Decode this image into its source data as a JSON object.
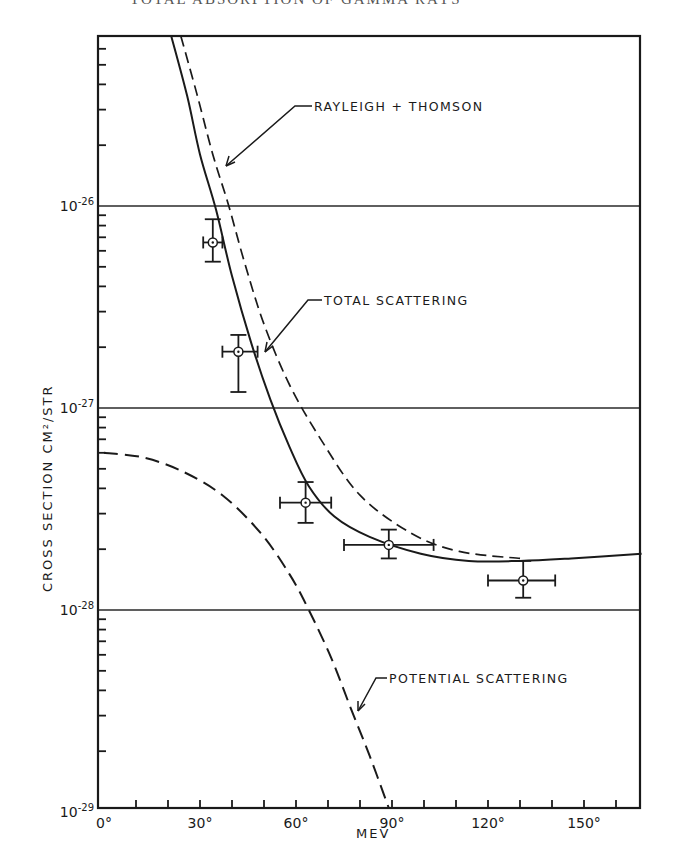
{
  "page": {
    "header_text": "TOTAL ABSORPTION OF GAMMA RAYS"
  },
  "chart_data": {
    "type": "line",
    "title": "",
    "xlabel": "MEV",
    "ylabel": "CROSS SECTION CM²/STR",
    "x_unit": "degrees",
    "xlim": [
      0,
      170
    ],
    "ylim": [
      1e-29,
      7e-26
    ],
    "yscale": "log",
    "grid": "horizontal lines at decades",
    "x_ticks": [
      {
        "value": 0,
        "label": "0°"
      },
      {
        "value": 30,
        "label": "30°"
      },
      {
        "value": 60,
        "label": "60°"
      },
      {
        "value": 90,
        "label": "90°"
      },
      {
        "value": 120,
        "label": "120°"
      },
      {
        "value": 150,
        "label": "150°"
      }
    ],
    "y_ticks": [
      {
        "value": 1e-26,
        "base": "10",
        "exp": "-26"
      },
      {
        "value": 1e-27,
        "base": "10",
        "exp": "-27"
      },
      {
        "value": 1e-28,
        "base": "10",
        "exp": "-28"
      },
      {
        "value": 1e-29,
        "base": "10",
        "exp": "-29"
      }
    ],
    "series": [
      {
        "name": "TOTAL SCATTERING",
        "style": "solid",
        "x": [
          21,
          26,
          30,
          35,
          40,
          46,
          52,
          58,
          64,
          72,
          83,
          99,
          114,
          130,
          146,
          168
        ],
        "y": [
          7e-26,
          3.5e-26,
          1.8e-26,
          9.6e-27,
          4.5e-27,
          2.1e-27,
          1.1e-27,
          6.4e-28,
          4.1e-28,
          2.9e-28,
          2.3e-28,
          1.9e-28,
          1.75e-28,
          1.75e-28,
          1.8e-28,
          1.9e-28
        ]
      },
      {
        "name": "RAYLEIGH + THOMSON",
        "style": "dashed",
        "x": [
          24,
          29,
          34,
          39,
          44,
          50,
          58,
          68,
          80,
          96,
          111,
          130
        ],
        "y": [
          7e-26,
          3.6e-26,
          1.8e-26,
          1e-26,
          5.2e-27,
          2.6e-27,
          1.3e-27,
          6.9e-28,
          3.7e-28,
          2.4e-28,
          1.95e-28,
          1.8e-28
        ]
      },
      {
        "name": "POTENTIAL SCATTERING",
        "style": "dashed",
        "x": [
          0,
          12,
          24,
          37,
          49,
          58,
          64,
          71,
          77,
          83,
          89
        ],
        "y": [
          6e-28,
          5.7e-28,
          4.9e-28,
          3.7e-28,
          2.4e-28,
          1.5e-28,
          1e-28,
          5.8e-29,
          3.3e-29,
          1.9e-29,
          1e-29
        ]
      }
    ],
    "data_points": [
      {
        "x": 34,
        "y": 6.6e-27,
        "x_err": [
          31,
          37
        ],
        "y_err": [
          5.3e-27,
          8.6e-27
        ]
      },
      {
        "x": 42,
        "y": 1.9e-27,
        "x_err": [
          37,
          48
        ],
        "y_err": [
          1.2e-27,
          2.3e-27
        ]
      },
      {
        "x": 63,
        "y": 3.4e-28,
        "x_err": [
          55,
          71
        ],
        "y_err": [
          2.7e-28,
          4.3e-28
        ]
      },
      {
        "x": 89,
        "y": 2.1e-28,
        "x_err": [
          75,
          103
        ],
        "y_err": [
          1.8e-28,
          2.5e-28
        ]
      },
      {
        "x": 131,
        "y": 1.4e-28,
        "x_err": [
          120,
          141
        ],
        "y_err": [
          1.15e-28,
          1.75e-28
        ]
      }
    ],
    "annotations": [
      {
        "text": "RAYLEIGH + THOMSON",
        "points_to": "RAYLEIGH + THOMSON"
      },
      {
        "text": "TOTAL SCATTERING",
        "points_to": "TOTAL SCATTERING"
      },
      {
        "text": "POTENTIAL SCATTERING",
        "points_to": "POTENTIAL SCATTERING"
      }
    ]
  }
}
